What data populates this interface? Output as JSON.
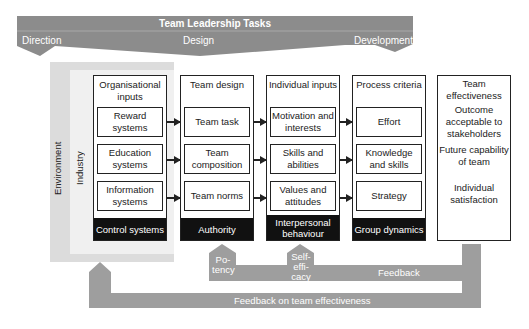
{
  "banner": {
    "title": "Team Leadership Tasks",
    "labels": [
      "Direction",
      "Design",
      "Development"
    ]
  },
  "context": {
    "environment": "Environment",
    "industry": "Industry"
  },
  "columns": [
    {
      "title": "Organisational inputs",
      "items": [
        "Reward systems",
        "Education systems",
        "Information systems"
      ],
      "footer": "Control systems"
    },
    {
      "title": "Team design",
      "items": [
        "Team task",
        "Team composition",
        "Team norms"
      ],
      "footer": "Authority"
    },
    {
      "title": "Individual inputs",
      "items": [
        "Motivation and interests",
        "Skills and abilities",
        "Values and attitudes"
      ],
      "footer": "Interpersonal behaviour"
    },
    {
      "title": "Process criteria",
      "items": [
        "Effort",
        "Knowledge and skills",
        "Strategy"
      ],
      "footer": "Group dynamics"
    }
  ],
  "effectiveness": {
    "title": "Team effectiveness",
    "items": [
      "Outcome acceptable to stakeholders",
      "Future capability of team",
      "Individual satisfaction"
    ]
  },
  "feedback": {
    "potency": "Po-\ntency",
    "self_efficacy": "Self-\neffi-\ncacy",
    "inner_label": "Feedback",
    "outer_label": "Feedback on team effectiveness"
  },
  "colors": {
    "banner": "#8c8c8c",
    "feedback": "#9e9e9e",
    "environment": "#dcdcdc",
    "industry": "#f0f0f0",
    "footer": "#111111"
  }
}
